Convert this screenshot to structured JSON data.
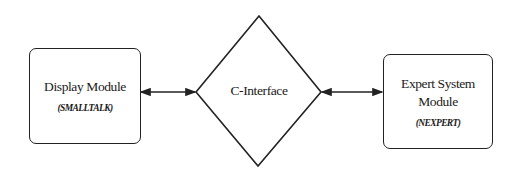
{
  "diagram": {
    "nodes": [
      {
        "id": "display",
        "shape": "rounded-rect",
        "title": "Display Module",
        "subtitle": "(SMALLTALK)"
      },
      {
        "id": "c_interface",
        "shape": "diamond",
        "title": "C-Interface"
      },
      {
        "id": "expert",
        "shape": "rounded-rect",
        "title_line1": "Expert System",
        "title_line2": "Module",
        "subtitle": "(NEXPERT)"
      }
    ],
    "edges": [
      {
        "from": "display",
        "to": "c_interface",
        "direction": "bidirectional"
      },
      {
        "from": "c_interface",
        "to": "expert",
        "direction": "bidirectional"
      }
    ],
    "colors": {
      "stroke": "#222222",
      "background": "#ffffff",
      "text": "#1a1a1a"
    }
  }
}
